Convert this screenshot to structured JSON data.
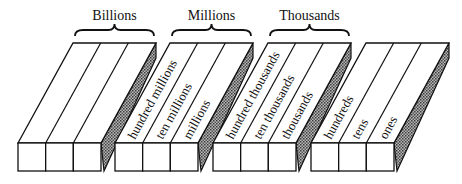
{
  "diagram": {
    "colors": {
      "stroke": "#111111",
      "fill": "#ffffff",
      "side_shade": "#8a8a8a"
    },
    "groups": [
      {
        "name": "Billions",
        "places": [
          "",
          "",
          ""
        ]
      },
      {
        "name": "Millions",
        "places": [
          "hundred millions",
          "ten millions",
          "millions"
        ]
      },
      {
        "name": "Thousands",
        "places": [
          "hundred thousands",
          "ten thousands",
          "thousands"
        ]
      },
      {
        "name": "",
        "places": [
          "hundreds",
          "tens",
          "ones"
        ]
      }
    ]
  }
}
